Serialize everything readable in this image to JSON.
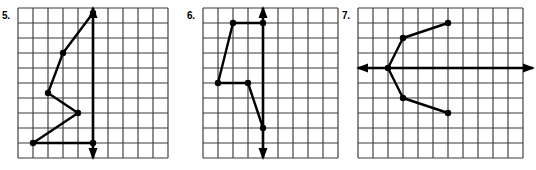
{
  "page": {
    "background_color": "#ffffff",
    "ink_color": "#000000",
    "grid_line_color": "#3a3a3a"
  },
  "problems": [
    {
      "number_label": "5.",
      "label_x": 2,
      "label_y": 10,
      "grid": {
        "x": 18,
        "y": 8,
        "cols": 10,
        "rows": 10,
        "cell": 15
      },
      "axis": {
        "type": "vertical",
        "x": 93,
        "y_top": 8,
        "y_bottom": 158,
        "arrow_top": true,
        "arrow_bottom": true
      },
      "polyline_points": "93,143 33,143 78,113 48,93 63,53 93,13",
      "vertices": [
        {
          "x": 93,
          "y": 143
        },
        {
          "x": 33,
          "y": 143
        },
        {
          "x": 78,
          "y": 113
        },
        {
          "x": 48,
          "y": 93
        },
        {
          "x": 63,
          "y": 53
        },
        {
          "x": 93,
          "y": 13
        }
      ]
    },
    {
      "number_label": "6.",
      "label_x": 187,
      "label_y": 10,
      "grid": {
        "x": 203,
        "y": 8,
        "cols": 9,
        "rows": 10,
        "cell": 15
      },
      "axis": {
        "type": "vertical",
        "x": 263,
        "y_top": 8,
        "y_bottom": 158,
        "arrow_top": true,
        "arrow_bottom": true
      },
      "polyline_points": "263,23 233,23 218,83 248,83 263,128",
      "vertices": [
        {
          "x": 263,
          "y": 23
        },
        {
          "x": 233,
          "y": 23
        },
        {
          "x": 218,
          "y": 83
        },
        {
          "x": 248,
          "y": 83
        },
        {
          "x": 263,
          "y": 128
        }
      ]
    },
    {
      "number_label": "7.",
      "label_x": 342,
      "label_y": 10,
      "grid": {
        "x": 358,
        "y": 8,
        "cols": 11,
        "rows": 10,
        "cell": 15
      },
      "axis": {
        "type": "horizontal",
        "y": 68,
        "x_left": 358,
        "x_right": 533,
        "arrow_left": true,
        "arrow_right": true
      },
      "polyline_points": "448,23 403,38 388,68 403,98 448,113",
      "vertices": [
        {
          "x": 448,
          "y": 23
        },
        {
          "x": 403,
          "y": 38
        },
        {
          "x": 388,
          "y": 68
        },
        {
          "x": 403,
          "y": 98
        },
        {
          "x": 448,
          "y": 113
        }
      ]
    }
  ]
}
